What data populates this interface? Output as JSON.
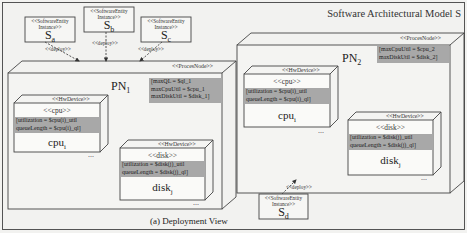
{
  "diagram": {
    "title": "Software Architectural Model S",
    "caption": "(a) Deployment View",
    "colors": {
      "attribute_band": "#a8a8a8",
      "background": "#f2f2f0",
      "line": "#333333"
    }
  },
  "software_entities": [
    {
      "id": "sa",
      "stereotype_line1": "<<SoftwareEntity",
      "stereotype_line2": "Instance>>",
      "name": "S",
      "sub": "a",
      "deploy_label": "<<deploy>>"
    },
    {
      "id": "sb",
      "stereotype_line1": "<<SoftwareEntity",
      "stereotype_line2": "Instance>>",
      "name": "S",
      "sub": "b",
      "deploy_label": "<<deploy>>"
    },
    {
      "id": "sc",
      "stereotype_line1": "<<SoftwareEntity",
      "stereotype_line2": "Instance>>",
      "name": "S",
      "sub": "c",
      "deploy_label": "<<deploy>>"
    },
    {
      "id": "sd",
      "stereotype_line1": "<<SoftwareEntity",
      "stereotype_line2": "Instance>>",
      "name": "S",
      "sub": "d",
      "deploy_label": "<<deploy>>"
    }
  ],
  "process_nodes": [
    {
      "stereotype": "<<ProcesNode>>",
      "name": "PN",
      "sub": "1",
      "attributes": [
        "[maxQL = $ql_1",
        " maxCpuUtil = $cpu_1",
        " maxDiskUtil = $disk_1]"
      ],
      "devices": [
        {
          "stereotype": "<<HwDevice>>",
          "kind": "<<cpu>>",
          "attributes": [
            "[utilization = $cpu(i)_util",
            " queueLength = $cpu(i)_ql]"
          ],
          "name": "cpu",
          "sub": "i",
          "more": "..."
        },
        {
          "stereotype": "<<HwDevice>>",
          "kind": "<<disk>>",
          "attributes": [
            "[utilization = $disk(j)_util",
            " queueLength = $disk(j)_ql]"
          ],
          "name": "disk",
          "sub": "j",
          "more": "..."
        }
      ]
    },
    {
      "stereotype": "<<ProcesNode>>",
      "name": "PN",
      "sub": "2",
      "attributes": [
        "[maxCpuUtil = $cpu_2",
        " maxDiskUtil = $disk_2]"
      ],
      "devices": [
        {
          "stereotype": "<<HwDevice>>",
          "kind": "<<cpu>>",
          "attributes": [
            "[utilization = $cpu(i)_util",
            " queueLength = $cpu(i)_ql]"
          ],
          "name": "cpu",
          "sub": "i",
          "more": "..."
        },
        {
          "stereotype": "<<HwDevice>>",
          "kind": "<<disk>>",
          "attributes": [
            "[utilization = $disk(j)_util",
            " queueLength = $disk(j)_ql]"
          ],
          "name": "disk",
          "sub": "j",
          "more": "..."
        }
      ]
    }
  ]
}
